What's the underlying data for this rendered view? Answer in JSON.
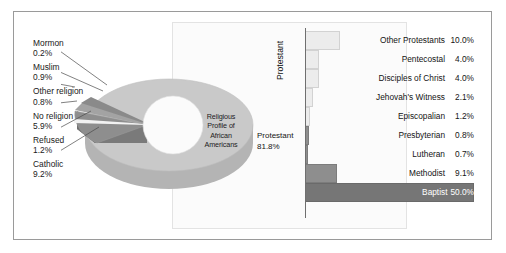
{
  "chart_data": [
    {
      "type": "pie",
      "title": "Religious Profile of African Americans",
      "center_title_lines": [
        "Religious",
        "Profile of",
        "African",
        "Americans"
      ],
      "categories": [
        "Protestant",
        "Catholic",
        "Refused",
        "No religion",
        "Other religion",
        "Muslim",
        "Mormon"
      ],
      "values": [
        81.8,
        9.2,
        1.2,
        5.9,
        0.8,
        0.9,
        0.2
      ],
      "labels": [
        {
          "name": "Mormon",
          "value": "0.2%"
        },
        {
          "name": "Muslim",
          "value": "0.9%"
        },
        {
          "name": "Other religion",
          "value": "0.8%"
        },
        {
          "name": "No religion",
          "value": "5.9%"
        },
        {
          "name": "Refused",
          "value": "1.2%"
        },
        {
          "name": "Catholic",
          "value": "9.2%"
        }
      ],
      "main_slice": {
        "name": "Protestant",
        "value": "81.8%"
      },
      "legend": "none",
      "grid": false
    },
    {
      "type": "bar",
      "orientation": "horizontal",
      "ylabel": "Protestant",
      "xlabel": "",
      "grid": false,
      "legend": "none",
      "xlim": [
        0,
        50
      ],
      "categories": [
        "Other Protestants",
        "Pentecostal",
        "Disciples of Christ",
        "Jehovah's Witness",
        "Episcopalian",
        "Presbyterian",
        "Lutheran",
        "Methodist",
        "Baptist"
      ],
      "values": [
        10.0,
        4.0,
        4.0,
        2.1,
        1.2,
        0.8,
        0.7,
        9.1,
        50.0
      ],
      "value_labels": [
        "10.0%",
        "4.0%",
        "4.0%",
        "2.1%",
        "1.2%",
        "0.8%",
        "0.7%",
        "9.1%",
        "50.0%"
      ]
    }
  ],
  "pie": {
    "center_lines": [
      "Religious",
      "Profile of",
      "African",
      "Americans"
    ],
    "protestant": {
      "name": "Protestant",
      "value": "81.8%"
    },
    "callouts": [
      {
        "name": "Mormon",
        "value": "0.2%"
      },
      {
        "name": "Muslim",
        "value": "0.9%"
      },
      {
        "name": "Other religion",
        "value": "0.8%"
      },
      {
        "name": "No religion",
        "value": "5.9%"
      },
      {
        "name": "Refused",
        "value": "1.2%"
      },
      {
        "name": "Catholic",
        "value": "9.2%"
      }
    ]
  },
  "bars": {
    "axis_title": "Protestant",
    "rows": [
      {
        "name": "Other Protestants",
        "value": "10.0%",
        "pct": 10.0,
        "style": "light"
      },
      {
        "name": "Pentecostal",
        "value": "4.0%",
        "pct": 4.0,
        "style": "light"
      },
      {
        "name": "Disciples of Christ",
        "value": "4.0%",
        "pct": 4.0,
        "style": "light"
      },
      {
        "name": "Jehovah's Witness",
        "value": "2.1%",
        "pct": 2.1,
        "style": "light"
      },
      {
        "name": "Episcopalian",
        "value": "1.2%",
        "pct": 1.2,
        "style": "light"
      },
      {
        "name": "Presbyterian",
        "value": "0.8%",
        "pct": 0.8,
        "style": "dark"
      },
      {
        "name": "Lutheran",
        "value": "0.7%",
        "pct": 0.7,
        "style": "dark"
      },
      {
        "name": "Methodist",
        "value": "9.1%",
        "pct": 9.1,
        "style": "dark"
      },
      {
        "name": "Baptist",
        "value": "50.0%",
        "pct": 50.0,
        "style": "darkest"
      }
    ]
  },
  "colors": {
    "frame": "#9a9a9a",
    "pie_main": "#c9c9c9",
    "pie_main_side": "#b4b4b4",
    "pie_exploded": "#8e8e8e",
    "pie_exploded_side": "#7a7a7a",
    "bar_light": "#ececec",
    "bar_dark": "#8e8e8e",
    "bar_darkest": "#767676",
    "text": "#141414"
  }
}
